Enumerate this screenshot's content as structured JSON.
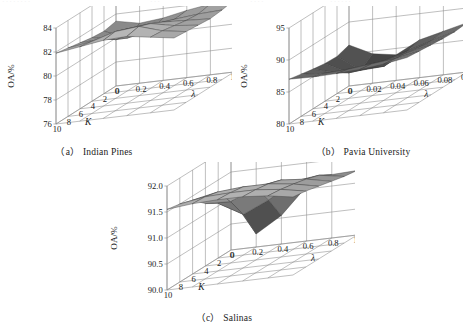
{
  "figure": {
    "page_bleed": [
      "········",
      "···",
      "····",
      "······"
    ],
    "axis_color": "#8a8a8a",
    "mesh_edge_color": "#3c3c3c",
    "text_color": "#1a1a1a"
  },
  "chart_data": [
    {
      "type": "surface",
      "id": "indian-pines",
      "caption": "（a） Indian Pines",
      "title": "",
      "xlabel": "λ",
      "ylabel": "K",
      "zlabel": "OA/%",
      "grid": true,
      "legend": "none",
      "xticks": [
        "0",
        "0.2",
        "0.4",
        "0.6",
        "0.8",
        "1.0"
      ],
      "yticks": [
        "10",
        "8",
        "6",
        "4",
        "2",
        "0"
      ],
      "zticks": [
        "76",
        "78",
        "80",
        "82",
        "84"
      ],
      "x": [
        0,
        0.2,
        0.4,
        0.6,
        0.8,
        1.0
      ],
      "y": [
        10,
        8,
        6,
        4,
        2,
        0
      ],
      "zlim": [
        76,
        84
      ],
      "xlim": [
        0,
        1.0
      ],
      "ylim": [
        0,
        10
      ],
      "values": [
        [
          81.9,
          82.2,
          82.5,
          82.6,
          82.3,
          82.0
        ],
        [
          81.7,
          82.0,
          82.6,
          82.8,
          82.2,
          81.9
        ],
        [
          81.5,
          81.6,
          82.2,
          82.4,
          82.0,
          81.8
        ],
        [
          81.3,
          80.9,
          81.4,
          81.9,
          81.8,
          81.7
        ],
        [
          81.2,
          80.4,
          80.8,
          81.5,
          81.7,
          81.8
        ],
        [
          81.4,
          81.0,
          81.2,
          81.6,
          81.9,
          82.0
        ]
      ]
    },
    {
      "type": "surface",
      "id": "pavia-university",
      "caption": "（b） Pavia University",
      "title": "",
      "xlabel": "λ",
      "ylabel": "K",
      "zlabel": "OA/%",
      "grid": true,
      "legend": "none",
      "xticks": [
        "0",
        "0.02",
        "0.04",
        "0.06",
        "0.08",
        "0.10"
      ],
      "yticks": [
        "10",
        "8",
        "6",
        "4",
        "2",
        "0"
      ],
      "zticks": [
        "80",
        "85",
        "90",
        "95"
      ],
      "x": [
        0,
        0.02,
        0.04,
        0.06,
        0.08,
        0.1
      ],
      "y": [
        10,
        8,
        6,
        4,
        2,
        0
      ],
      "zlim": [
        80,
        95
      ],
      "xlim": [
        0,
        0.1
      ],
      "ylim": [
        0,
        10
      ],
      "values": [
        [
          87.0,
          86.9,
          87.0,
          87.2,
          87.6,
          88.2
        ],
        [
          86.6,
          86.3,
          86.5,
          86.9,
          87.3,
          88.0
        ],
        [
          86.2,
          85.2,
          85.6,
          86.2,
          87.0,
          87.8
        ],
        [
          85.9,
          84.0,
          84.4,
          85.8,
          86.7,
          87.6
        ],
        [
          85.8,
          83.2,
          83.4,
          85.4,
          86.5,
          87.5
        ],
        [
          86.4,
          84.6,
          84.0,
          85.9,
          86.8,
          87.7
        ]
      ]
    },
    {
      "type": "surface",
      "id": "salinas",
      "caption": "（c） Salinas",
      "title": "",
      "xlabel": "λ",
      "ylabel": "K",
      "zlabel": "OA/%",
      "grid": true,
      "legend": "none",
      "xticks": [
        "0",
        "0.2",
        "0.4",
        "0.6",
        "0.8",
        "1.0"
      ],
      "yticks": [
        "10",
        "8",
        "6",
        "4",
        "2",
        "0"
      ],
      "zticks": [
        "90.0",
        "90.5",
        "91.0",
        "91.5",
        "92.0"
      ],
      "x": [
        0,
        0.2,
        0.4,
        0.6,
        0.8,
        1.0
      ],
      "y": [
        10,
        8,
        6,
        4,
        2,
        0
      ],
      "zlim": [
        90.0,
        92.0
      ],
      "xlim": [
        0,
        1.0
      ],
      "ylim": [
        0,
        10
      ],
      "values": [
        [
          91.55,
          91.6,
          91.62,
          91.62,
          91.58,
          91.5
        ],
        [
          91.5,
          91.58,
          91.6,
          91.6,
          91.55,
          91.46
        ],
        [
          91.42,
          91.52,
          91.56,
          91.56,
          91.5,
          91.4
        ],
        [
          91.2,
          91.18,
          91.4,
          91.48,
          91.44,
          91.34
        ],
        [
          91.05,
          90.78,
          91.0,
          91.3,
          91.36,
          91.28
        ],
        [
          91.0,
          90.25,
          90.55,
          91.05,
          91.22,
          91.24
        ]
      ]
    }
  ]
}
